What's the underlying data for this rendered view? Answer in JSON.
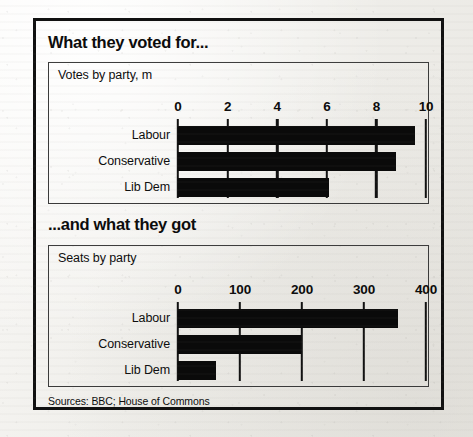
{
  "figure": {
    "source_note": "Sources: BBC; House of Commons",
    "ink_color": "#0a0a0a",
    "paper_color": "#f3f2ef",
    "frame_color": "#111111"
  },
  "blocks": [
    {
      "heading": "What they voted for...",
      "subtitle": "Votes by party, m"
    },
    {
      "heading": "...and what they got",
      "subtitle": "Seats by party"
    }
  ],
  "chart_data": [
    {
      "type": "bar",
      "orientation": "horizontal",
      "title": "What they voted for...",
      "subtitle": "Votes by party, m",
      "xlabel": "",
      "ylabel": "",
      "categories": [
        "Labour",
        "Conservative",
        "Lib Dem"
      ],
      "values": [
        9.55,
        8.8,
        6.1
      ],
      "unit": "millions of votes",
      "xlim": [
        0,
        10
      ],
      "xticks": [
        0,
        2,
        4,
        6,
        8,
        10
      ],
      "xticklabels": [
        "0",
        "2",
        "4",
        "6",
        "8",
        "10"
      ],
      "grid": false,
      "legend": false,
      "bar_color": "#0a0a0a"
    },
    {
      "type": "bar",
      "orientation": "horizontal",
      "title": "...and what they got",
      "subtitle": "Seats by party",
      "xlabel": "",
      "ylabel": "",
      "categories": [
        "Labour",
        "Conservative",
        "Lib Dem"
      ],
      "values": [
        355,
        198,
        62
      ],
      "unit": "seats",
      "xlim": [
        0,
        400
      ],
      "xticks": [
        0,
        100,
        200,
        300,
        400
      ],
      "xticklabels": [
        "0",
        "100",
        "200",
        "300",
        "400"
      ],
      "grid": false,
      "legend": false,
      "bar_color": "#0a0a0a"
    }
  ]
}
